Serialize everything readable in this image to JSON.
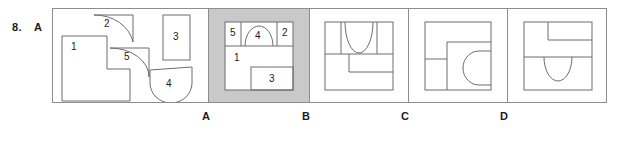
{
  "question": {
    "number": "8.",
    "answer": "A"
  },
  "prompt_panel": {
    "name": "pieces-panel",
    "pieces": [
      {
        "id": "1",
        "label": "1",
        "shape": "l-shape"
      },
      {
        "id": "2",
        "label": "2",
        "shape": "square-with-concave-arc"
      },
      {
        "id": "3",
        "label": "3",
        "shape": "vertical-rectangle"
      },
      {
        "id": "4",
        "label": "4",
        "shape": "half-disc"
      },
      {
        "id": "5",
        "label": "5",
        "shape": "square-with-concave-arc"
      }
    ]
  },
  "options": [
    {
      "letter": "A",
      "selected": true,
      "shaded": true,
      "assembled_labels": [
        "5",
        "4",
        "2",
        "1",
        "3"
      ]
    },
    {
      "letter": "B",
      "selected": false,
      "shaded": false,
      "assembled_labels": []
    },
    {
      "letter": "C",
      "selected": false,
      "shaded": false,
      "assembled_labels": []
    },
    {
      "letter": "D",
      "selected": false,
      "shaded": false,
      "assembled_labels": []
    }
  ],
  "colors": {
    "line": "#6d6d6d",
    "frame": "#8d8d8d",
    "shade": "#c9c9c9",
    "text": "#1b1b1b",
    "background": "#ffffff"
  }
}
